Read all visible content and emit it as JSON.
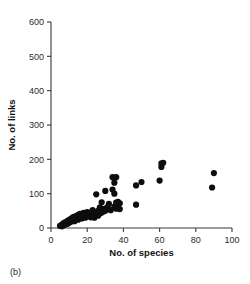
{
  "figure": {
    "panel_label": "(b)",
    "background_color": "#ffffff",
    "point_color": "#0d0d0d",
    "axis_color": "#3a3a3a"
  },
  "chart_data": {
    "type": "scatter",
    "title": "",
    "xlabel": "No. of species",
    "ylabel": "No. of links",
    "xlim": [
      0,
      100
    ],
    "ylim": [
      0,
      600
    ],
    "xticks": [
      0,
      20,
      40,
      60,
      80,
      100
    ],
    "yticks": [
      0,
      100,
      200,
      300,
      400,
      500,
      600
    ],
    "xtick_labels": [
      "0",
      "20",
      "40",
      "60",
      "80",
      "100"
    ],
    "ytick_labels": [
      "0",
      "100",
      "200",
      "300",
      "400",
      "500",
      "600"
    ],
    "grid": false,
    "legend": false,
    "marker": "filled-circle",
    "marker_size": 3.1,
    "series": [
      {
        "name": "food webs",
        "points": [
          [
            5,
            6
          ],
          [
            6,
            5
          ],
          [
            6,
            10
          ],
          [
            7,
            8
          ],
          [
            7,
            14
          ],
          [
            8,
            10
          ],
          [
            8,
            17
          ],
          [
            9,
            12
          ],
          [
            9,
            20
          ],
          [
            10,
            15
          ],
          [
            10,
            24
          ],
          [
            11,
            18
          ],
          [
            11,
            27
          ],
          [
            12,
            22
          ],
          [
            12,
            31
          ],
          [
            13,
            20
          ],
          [
            13,
            33
          ],
          [
            14,
            26
          ],
          [
            14,
            35
          ],
          [
            15,
            24
          ],
          [
            15,
            38
          ],
          [
            16,
            30
          ],
          [
            16,
            41
          ],
          [
            17,
            28
          ],
          [
            17,
            35
          ],
          [
            18,
            33
          ],
          [
            18,
            44
          ],
          [
            19,
            30
          ],
          [
            19,
            40
          ],
          [
            20,
            36
          ],
          [
            20,
            46
          ],
          [
            21,
            34
          ],
          [
            21,
            42
          ],
          [
            22,
            31
          ],
          [
            22,
            45
          ],
          [
            23,
            38
          ],
          [
            23,
            52
          ],
          [
            24,
            40
          ],
          [
            24,
            30
          ],
          [
            25,
            44
          ],
          [
            25,
            98
          ],
          [
            26,
            36
          ],
          [
            26,
            50
          ],
          [
            27,
            42
          ],
          [
            27,
            60
          ],
          [
            28,
            45
          ],
          [
            28,
            75
          ],
          [
            29,
            48
          ],
          [
            29,
            55
          ],
          [
            30,
            50
          ],
          [
            30,
            108
          ],
          [
            31,
            60
          ],
          [
            32,
            70
          ],
          [
            33,
            52
          ],
          [
            34,
            112
          ],
          [
            34,
            148
          ],
          [
            35,
            62
          ],
          [
            35,
            100
          ],
          [
            35,
            132
          ],
          [
            36,
            56
          ],
          [
            36,
            74
          ],
          [
            36,
            148
          ],
          [
            37,
            70
          ],
          [
            37,
            76
          ],
          [
            38,
            55
          ],
          [
            38,
            72
          ],
          [
            47,
            68
          ],
          [
            47,
            124
          ],
          [
            50,
            134
          ],
          [
            60,
            138
          ],
          [
            61,
            178
          ],
          [
            61,
            188
          ],
          [
            62,
            190
          ],
          [
            89,
            118
          ],
          [
            90,
            160
          ]
        ]
      }
    ]
  }
}
